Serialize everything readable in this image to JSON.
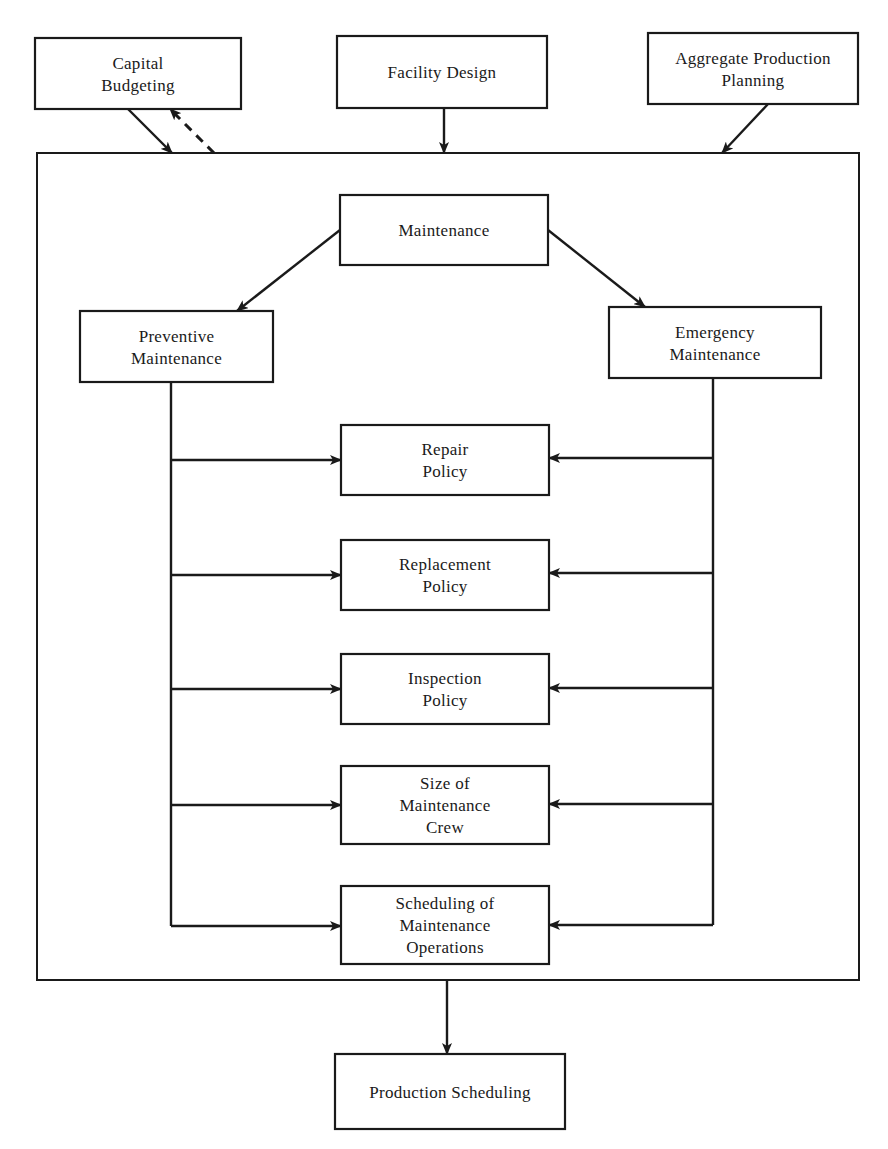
{
  "diagram": {
    "colors": {
      "stroke": "#1a1a1a",
      "background": "#ffffff"
    },
    "frame": {
      "x": 37,
      "y": 153,
      "w": 822,
      "h": 827
    },
    "nodes": [
      {
        "id": "capital-budgeting",
        "lines": [
          "Capital",
          "Budgeting"
        ],
        "x": 35,
        "y": 38,
        "w": 206,
        "h": 71
      },
      {
        "id": "facility-design",
        "lines": [
          "Facility Design"
        ],
        "x": 337,
        "y": 36,
        "w": 210,
        "h": 72
      },
      {
        "id": "aggregate-production-planning",
        "lines": [
          "Aggregate Production",
          "Planning"
        ],
        "x": 648,
        "y": 33,
        "w": 210,
        "h": 71
      },
      {
        "id": "maintenance",
        "lines": [
          "Maintenance"
        ],
        "x": 340,
        "y": 195,
        "w": 208,
        "h": 70
      },
      {
        "id": "preventive-maintenance",
        "lines": [
          "Preventive",
          "Maintenance"
        ],
        "x": 80,
        "y": 311,
        "w": 193,
        "h": 71
      },
      {
        "id": "emergency-maintenance",
        "lines": [
          "Emergency",
          "Maintenance"
        ],
        "x": 609,
        "y": 307,
        "w": 212,
        "h": 71
      },
      {
        "id": "repair-policy",
        "lines": [
          "Repair",
          "Policy"
        ],
        "x": 341,
        "y": 425,
        "w": 208,
        "h": 70
      },
      {
        "id": "replacement-policy",
        "lines": [
          "Replacement",
          "Policy"
        ],
        "x": 341,
        "y": 540,
        "w": 208,
        "h": 70
      },
      {
        "id": "inspection-policy",
        "lines": [
          "Inspection",
          "Policy"
        ],
        "x": 341,
        "y": 654,
        "w": 208,
        "h": 70
      },
      {
        "id": "size-of-maintenance-crew",
        "lines": [
          "Size of",
          "Maintenance",
          "Crew"
        ],
        "x": 341,
        "y": 766,
        "w": 208,
        "h": 78
      },
      {
        "id": "scheduling-of-maintenance-operations",
        "lines": [
          "Scheduling of",
          "Maintenance",
          "Operations"
        ],
        "x": 341,
        "y": 886,
        "w": 208,
        "h": 78
      },
      {
        "id": "production-scheduling",
        "lines": [
          "Production Scheduling"
        ],
        "x": 335,
        "y": 1054,
        "w": 230,
        "h": 75
      }
    ],
    "edges": [
      {
        "id": "capital-to-frame",
        "from": "capital-budgeting",
        "to": "frame",
        "style": "solid",
        "points": [
          [
            128,
            109
          ],
          [
            172,
            153
          ]
        ]
      },
      {
        "id": "frame-to-capital",
        "from": "frame",
        "to": "capital-budgeting",
        "style": "dashed",
        "points": [
          [
            214,
            153
          ],
          [
            170,
            109
          ]
        ]
      },
      {
        "id": "facility-to-frame",
        "from": "facility-design",
        "to": "frame",
        "style": "solid",
        "points": [
          [
            444,
            108
          ],
          [
            444,
            153
          ]
        ]
      },
      {
        "id": "aggregate-to-frame",
        "from": "aggregate-production-planning",
        "to": "frame",
        "style": "solid",
        "points": [
          [
            768,
            104
          ],
          [
            722,
            153
          ]
        ]
      },
      {
        "id": "maintenance-to-preventive",
        "from": "maintenance",
        "to": "preventive-maintenance",
        "style": "solid",
        "points": [
          [
            340,
            230
          ],
          [
            237,
            311
          ]
        ]
      },
      {
        "id": "maintenance-to-emergency",
        "from": "maintenance",
        "to": "emergency-maintenance",
        "style": "solid",
        "points": [
          [
            548,
            230
          ],
          [
            645,
            307
          ]
        ]
      },
      {
        "id": "frame-to-production",
        "from": "frame",
        "to": "production-scheduling",
        "style": "solid",
        "points": [
          [
            447,
            980
          ],
          [
            447,
            1054
          ]
        ]
      }
    ],
    "bus_left": {
      "x": 171,
      "top": 382,
      "bottom": 926,
      "targets_y": [
        460,
        575,
        689,
        805,
        926
      ],
      "arrow_to_x": 341
    },
    "bus_right": {
      "x": 713,
      "top": 378,
      "bottom": 925,
      "targets_y": [
        458,
        573,
        688,
        804,
        925
      ],
      "arrow_to_x": 549
    }
  }
}
